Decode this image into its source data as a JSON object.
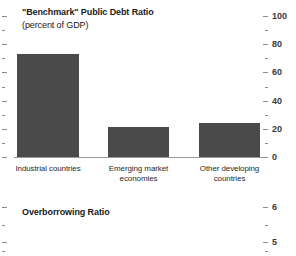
{
  "figure": {
    "background_color": "#ffffff",
    "bar_color": "#4a4a4a",
    "axis_color": "#8c8c8c"
  },
  "panels": [
    {
      "key": "debt",
      "title": "\"Benchmark\" Public Debt Ratio",
      "subtitle": "(percent of GDP)"
    },
    {
      "key": "overborrowing",
      "title": "Overborrowing Ratio",
      "subtitle": ""
    }
  ],
  "chart_data": [
    {
      "type": "bar",
      "title": "\"Benchmark\" Public Debt Ratio",
      "subtitle": "(percent of GDP)",
      "xlabel": "",
      "ylabel": "",
      "ylim": [
        0,
        100
      ],
      "grid": false,
      "legend": "none",
      "axis_position": "right",
      "categories": [
        "Industrial countries",
        "Emerging market economies",
        "Other developing countries"
      ],
      "category_lines": [
        [
          "Industrial countries"
        ],
        [
          "Emerging market",
          "economies"
        ],
        [
          "Other developing",
          "countries"
        ]
      ],
      "values": [
        73,
        21,
        24
      ],
      "major_ticks": [
        0,
        20,
        40,
        60,
        80,
        100
      ],
      "major_tick_labels": [
        "0",
        "20",
        "40",
        "60",
        "80",
        "100"
      ],
      "minor_ticks": [
        10,
        30,
        50,
        70,
        90
      ]
    },
    {
      "type": "bar",
      "title": "Overborrowing Ratio",
      "subtitle": "",
      "xlabel": "",
      "ylabel": "",
      "ylim": [
        4.6,
        6.2
      ],
      "grid": false,
      "legend": "none",
      "axis_position": "right",
      "categories": [],
      "values": [],
      "major_ticks": [
        5,
        6
      ],
      "major_tick_labels": [
        "5",
        "6"
      ],
      "minor_ticks": [
        4.75,
        5.5
      ]
    }
  ]
}
